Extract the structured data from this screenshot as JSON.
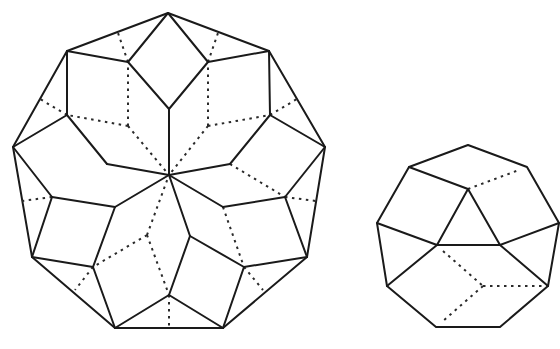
{
  "figure": {
    "background": "#ffffff",
    "stroke_color": "#1a1a1a",
    "shapes": [
      {
        "name": "large-nonagon-dissection",
        "outline": [
          [
            168,
            13
          ],
          [
            269,
            51
          ],
          [
            325,
            147
          ],
          [
            307,
            257
          ],
          [
            223,
            328
          ],
          [
            115,
            328
          ],
          [
            32,
            257
          ],
          [
            13,
            147
          ],
          [
            67,
            51
          ]
        ],
        "center": [
          169,
          175
        ],
        "solid_edges": [
          [
            [
              168,
              13
            ],
            [
              128,
              62
            ]
          ],
          [
            [
              128,
              62
            ],
            [
              67,
              51
            ]
          ],
          [
            [
              128,
              62
            ],
            [
              169,
              109
            ]
          ],
          [
            [
              168,
              13
            ],
            [
              208,
              62
            ]
          ],
          [
            [
              208,
              62
            ],
            [
              269,
              51
            ]
          ],
          [
            [
              208,
              62
            ],
            [
              169,
              109
            ]
          ],
          [
            [
              169,
              109
            ],
            [
              169,
              175
            ]
          ],
          [
            [
              67,
              51
            ],
            [
              67,
              115
            ]
          ],
          [
            [
              67,
              115
            ],
            [
              13,
              147
            ]
          ],
          [
            [
              67,
              115
            ],
            [
              107,
              164
            ]
          ],
          [
            [
              107,
              164
            ],
            [
              169,
              175
            ]
          ],
          [
            [
              269,
              51
            ],
            [
              270,
              115
            ]
          ],
          [
            [
              270,
              115
            ],
            [
              325,
              147
            ]
          ],
          [
            [
              270,
              115
            ],
            [
              230,
              164
            ]
          ],
          [
            [
              230,
              164
            ],
            [
              169,
              175
            ]
          ],
          [
            [
              13,
              147
            ],
            [
              52,
              197
            ]
          ],
          [
            [
              52,
              197
            ],
            [
              32,
              257
            ]
          ],
          [
            [
              52,
              197
            ],
            [
              115,
              207
            ]
          ],
          [
            [
              115,
              207
            ],
            [
              169,
              175
            ]
          ],
          [
            [
              325,
              147
            ],
            [
              285,
              197
            ]
          ],
          [
            [
              285,
              197
            ],
            [
              307,
              257
            ]
          ],
          [
            [
              285,
              197
            ],
            [
              223,
              207
            ]
          ],
          [
            [
              223,
              207
            ],
            [
              169,
              175
            ]
          ],
          [
            [
              115,
              207
            ],
            [
              93,
              267
            ]
          ],
          [
            [
              93,
              267
            ],
            [
              32,
              257
            ]
          ],
          [
            [
              93,
              267
            ],
            [
              115,
              328
            ]
          ],
          [
            [
              169,
              175
            ],
            [
              190,
              236
            ]
          ],
          [
            [
              190,
              236
            ],
            [
              244,
              267
            ]
          ],
          [
            [
              190,
              236
            ],
            [
              169,
              295
            ]
          ],
          [
            [
              244,
              267
            ],
            [
              307,
              257
            ]
          ],
          [
            [
              244,
              267
            ],
            [
              223,
              328
            ]
          ],
          [
            [
              169,
              295
            ],
            [
              115,
              328
            ]
          ],
          [
            [
              169,
              295
            ],
            [
              223,
              328
            ]
          ]
        ],
        "dashed_edges": [
          [
            [
              128,
              126
            ],
            [
              128,
              62
            ]
          ],
          [
            [
              128,
              126
            ],
            [
              67,
              115
            ]
          ],
          [
            [
              128,
              126
            ],
            [
              169,
              175
            ]
          ],
          [
            [
              208,
              126
            ],
            [
              208,
              62
            ]
          ],
          [
            [
              208,
              126
            ],
            [
              270,
              115
            ]
          ],
          [
            [
              208,
              126
            ],
            [
              169,
              175
            ]
          ],
          [
            [
              128,
              62
            ],
            [
              118,
              33
            ]
          ],
          [
            [
              208,
              62
            ],
            [
              218,
              33
            ]
          ],
          [
            [
              67,
              115
            ],
            [
              40,
              99
            ]
          ],
          [
            [
              270,
              115
            ],
            [
              297,
              99
            ]
          ],
          [
            [
              52,
              197
            ],
            [
              22,
              201
            ]
          ],
          [
            [
              285,
              197
            ],
            [
              316,
              201
            ]
          ],
          [
            [
              230,
              164
            ],
            [
              285,
              197
            ]
          ],
          [
            [
              147,
              235
            ],
            [
              169,
              175
            ]
          ],
          [
            [
              147,
              235
            ],
            [
              93,
              267
            ]
          ],
          [
            [
              147,
              235
            ],
            [
              169,
              295
            ]
          ],
          [
            [
              223,
              207
            ],
            [
              244,
              267
            ]
          ],
          [
            [
              93,
              267
            ],
            [
              75,
              290
            ]
          ],
          [
            [
              244,
              267
            ],
            [
              263,
              290
            ]
          ],
          [
            [
              169,
              295
            ],
            [
              169,
              328
            ]
          ]
        ]
      },
      {
        "name": "small-nonagon-dissection",
        "outline": [
          [
            468,
            145
          ],
          [
            527,
            167
          ],
          [
            559,
            223
          ],
          [
            548,
            286
          ],
          [
            500,
            327
          ],
          [
            436,
            327
          ],
          [
            387,
            286
          ],
          [
            377,
            223
          ],
          [
            409,
            167
          ]
        ],
        "solid_edges": [
          [
            [
              409,
              167
            ],
            [
              468,
              189
            ]
          ],
          [
            [
              468,
              189
            ],
            [
              437,
              245
            ]
          ],
          [
            [
              468,
              189
            ],
            [
              500,
              245
            ]
          ],
          [
            [
              437,
              245
            ],
            [
              500,
              245
            ]
          ],
          [
            [
              377,
              223
            ],
            [
              437,
              245
            ]
          ],
          [
            [
              500,
              245
            ],
            [
              559,
              223
            ]
          ],
          [
            [
              437,
              245
            ],
            [
              387,
              286
            ]
          ],
          [
            [
              500,
              245
            ],
            [
              548,
              286
            ]
          ]
        ],
        "dashed_edges": [
          [
            [
              468,
              189
            ],
            [
              519,
              170
            ]
          ],
          [
            [
              443,
              251
            ],
            [
              483,
              286
            ]
          ],
          [
            [
              483,
              286
            ],
            [
              443,
              321
            ]
          ],
          [
            [
              483,
              286
            ],
            [
              548,
              286
            ]
          ]
        ]
      }
    ]
  }
}
